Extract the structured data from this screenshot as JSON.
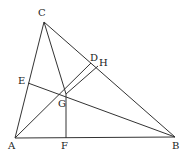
{
  "diagram": {
    "points": {
      "A": {
        "x": 15,
        "y": 138
      },
      "B": {
        "x": 175,
        "y": 137
      },
      "C": {
        "x": 44,
        "y": 22
      },
      "D": {
        "x": 91,
        "y": 63
      },
      "H": {
        "x": 98,
        "y": 66
      },
      "E": {
        "x": 28,
        "y": 83
      },
      "F": {
        "x": 66,
        "y": 138
      },
      "G": {
        "x": 66,
        "y": 94
      }
    },
    "labels": [
      {
        "text": "C",
        "x": 38,
        "y": 8
      },
      {
        "text": "D",
        "x": 90,
        "y": 53
      },
      {
        "text": "H",
        "x": 99,
        "y": 58
      },
      {
        "text": "E",
        "x": 18,
        "y": 76
      },
      {
        "text": "G",
        "x": 58,
        "y": 99
      },
      {
        "text": "A",
        "x": 8,
        "y": 141
      },
      {
        "text": "F",
        "x": 61,
        "y": 141
      },
      {
        "text": "B",
        "x": 172,
        "y": 141
      }
    ],
    "segments": [
      [
        "A",
        "C"
      ],
      [
        "C",
        "B"
      ],
      [
        "A",
        "B"
      ],
      [
        "C",
        "G"
      ],
      [
        "G",
        "F"
      ],
      [
        "E",
        "B"
      ],
      [
        "A",
        "D"
      ],
      [
        "G",
        "H"
      ]
    ],
    "stroke_color": "#333333"
  }
}
